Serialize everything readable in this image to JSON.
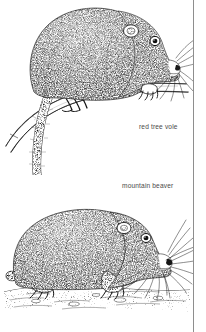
{
  "page": {
    "background_color": "#ffffff",
    "ink_color": "#1a1a1a",
    "width": 206,
    "height": 332,
    "rule_color": "#8e8e8e"
  },
  "captions": {
    "vole": "red tree vole",
    "beaver": "mountain beaver",
    "text_color": "#4a4a4a"
  },
  "figures": [
    {
      "id": "red-tree-vole",
      "caption": "red tree vole",
      "subject": "red tree vole",
      "pose": "perched on a downward-sloping branch, facing right",
      "features": [
        "rounded stippled body",
        "small rounded ear",
        "dark eye",
        "long radiating whiskers",
        "clawed fore and hind feet gripping branch",
        "very long thin tail hanging down to lower left"
      ],
      "style": "black and white stipple / pen-and-ink field guide illustration"
    },
    {
      "id": "mountain-beaver",
      "caption": "mountain beaver",
      "subject": "mountain beaver",
      "pose": "standing on ground, facing right",
      "features": [
        "stocky stippled body",
        "small rounded ear",
        "dark eye",
        "very prominent long radiating whiskers",
        "short stubby tail",
        "clawed feet on stippled ground line"
      ],
      "style": "black and white stipple / pen-and-ink field guide illustration"
    }
  ]
}
